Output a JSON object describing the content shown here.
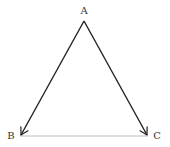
{
  "diagram": {
    "type": "directed-graph",
    "nodes": [
      {
        "id": "A",
        "label": "A",
        "x": 84,
        "y": 21,
        "label_x": 84,
        "label_y": 11
      },
      {
        "id": "B",
        "label": "B",
        "x": 20,
        "y": 136,
        "label_x": 11,
        "label_y": 136
      },
      {
        "id": "C",
        "label": "C",
        "x": 148,
        "y": 136,
        "label_x": 157,
        "label_y": 136
      }
    ],
    "edges": [
      {
        "from": "A",
        "to": "B",
        "directed": true,
        "color": "#222222"
      },
      {
        "from": "A",
        "to": "C",
        "directed": true,
        "color": "#222222"
      },
      {
        "from": "B",
        "to": "C",
        "directed": false,
        "color": "#aaaaaa"
      }
    ]
  },
  "labels": {
    "a": "A",
    "b": "B",
    "c": "C"
  }
}
